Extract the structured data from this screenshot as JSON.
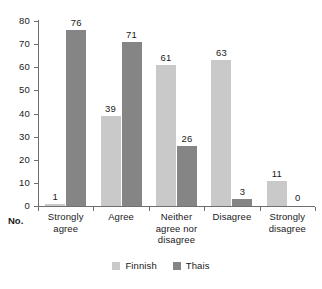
{
  "chart_data": {
    "type": "bar",
    "title": "",
    "subtitle": "",
    "xlabel": "No.",
    "ylabel": "",
    "ylim": [
      0,
      80
    ],
    "yticks": [
      0,
      10,
      20,
      30,
      40,
      50,
      60,
      70,
      80
    ],
    "ytick_labels": [
      "0",
      "10",
      "20",
      "30",
      "40",
      "50",
      "60",
      "70",
      "80"
    ],
    "grid": false,
    "legend_position": "bottom",
    "categories": [
      "Strongly agree",
      "Agree",
      "Neither agree nor disagree",
      "Disagree",
      "Strongly disagree"
    ],
    "category_lines": [
      [
        "Strongly",
        "agree"
      ],
      [
        "Agree"
      ],
      [
        "Neither",
        "agree nor",
        "disagree"
      ],
      [
        "Disagree"
      ],
      [
        "Strongly",
        "disagree"
      ]
    ],
    "series": [
      {
        "name": "Finnish",
        "color": "#c9c9c9",
        "values": [
          1,
          39,
          61,
          63,
          11
        ],
        "labels": [
          "1",
          "39",
          "61",
          "63",
          "11"
        ]
      },
      {
        "name": "Thais",
        "color": "#858585",
        "values": [
          76,
          71,
          26,
          3,
          0
        ],
        "labels": [
          "76",
          "71",
          "26",
          "3",
          "0"
        ]
      }
    ]
  },
  "axis": {
    "no_label": "No."
  },
  "legend": {
    "items": [
      {
        "label": "Finnish",
        "color": "#c9c9c9"
      },
      {
        "label": "Thais",
        "color": "#858585"
      }
    ]
  }
}
